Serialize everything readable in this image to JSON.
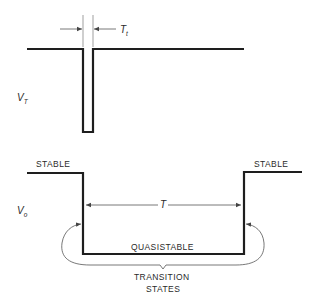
{
  "diagram": {
    "trigger_waveform": {
      "label": "V",
      "label_subscript": "T",
      "pulse_width_label": "T",
      "pulse_width_subscript": "t"
    },
    "output_waveform": {
      "label": "V",
      "label_subscript": "o",
      "period_label": "T",
      "left_state_label": "STABLE",
      "right_state_label": "STABLE",
      "middle_state_label": "QUASISTABLE",
      "transition_label_line1": "TRANSITION",
      "transition_label_line2": "STATES"
    },
    "colors": {
      "waveform": "#1e1e1e",
      "annotation": "#555555",
      "background": "#ffffff"
    }
  }
}
